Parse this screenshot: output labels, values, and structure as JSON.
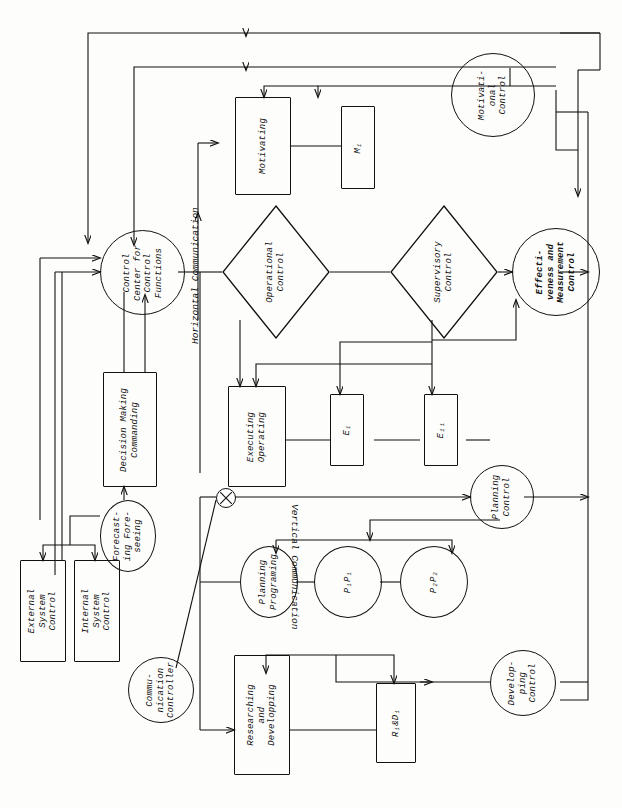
{
  "diagram": {
    "orientation": "landscape-rotated",
    "line_color": "#111111",
    "background": "#fdfdfb"
  },
  "free_labels": {
    "horizontal_communication": "Horizontal Communication",
    "vertical_communication": "Vertical Communication"
  },
  "nodes": {
    "motivational_control": "Motivati-\nonal\nControl",
    "motivating": "Motivating",
    "m1": "M₁",
    "control_center": "Control\nCenter for\nControl\nFunctions",
    "operational_control": "Operational\nControl",
    "supervisory_control": "Supervisory\nControl",
    "effectiveness_control": "Effecti-\nveness and\nMeasurement\nControl",
    "decision_making": "Decision Making\nCommanding",
    "executing_operating": "Executing\nOperating",
    "e1": "E₁",
    "e11": "E₁₁",
    "forecasting": "Forecast-\ning Fore-\nseeing",
    "external_system_control": "External\nSystem\nControl",
    "internal_system_control": "Internal\nSystem\nControl",
    "communication_controller": "Commu-\nnication\nController",
    "planning_control": "Planning\nControl",
    "planning_programing": "Planning\nPrograming",
    "p1p1": "P₁P₁",
    "p2p2": "P₂P₂",
    "developping_control": "Develop-\nping\nControl",
    "researching_developping": "Researching\nand\nDevelopping",
    "r1d1": "R₁&D₁",
    "cross_junction": "⊗"
  }
}
